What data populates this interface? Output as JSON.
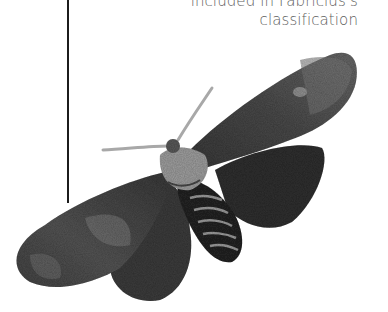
{
  "caption": {
    "line1": "included in Fabricius's",
    "line2": "classification"
  },
  "illustration": {
    "subject": "moth-engraving",
    "style": "grayscale",
    "colors": {
      "wing_dark": "#2b2b2b",
      "wing_mid": "#555555",
      "wing_light": "#9a9a9a",
      "body_light": "#b5b5b5",
      "antenna": "#a8a8a8",
      "leader_line": "#1c1c1c",
      "caption_text": "#5e5e5e"
    }
  }
}
